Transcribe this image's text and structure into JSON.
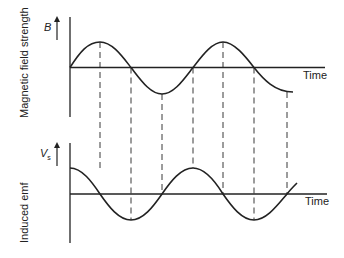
{
  "diagram": {
    "top_panel": {
      "axis_label": "Magnetic field strength",
      "symbol": "B",
      "time_label": "Time",
      "curve": "sine"
    },
    "bottom_panel": {
      "axis_label": "Induced emf",
      "symbol": "V",
      "symbol_subscript": "s",
      "time_label": "Time",
      "curve": "cosine"
    },
    "colors": {
      "line": "#222222",
      "background": "#ffffff"
    }
  }
}
